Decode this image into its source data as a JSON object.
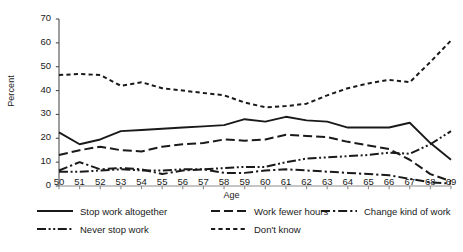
{
  "chart_data": {
    "type": "line",
    "title": "",
    "xlabel": "Age",
    "ylabel": "Percent",
    "xlim": [
      50,
      69
    ],
    "ylim": [
      0,
      70
    ],
    "ytick_step": 10,
    "grid": false,
    "legend_position": "bottom",
    "x": [
      50,
      51,
      52,
      53,
      54,
      55,
      56,
      57,
      58,
      59,
      60,
      61,
      62,
      63,
      64,
      65,
      66,
      67,
      68,
      69
    ],
    "xticklabels": [
      "50",
      "51",
      "52",
      "53",
      "54",
      "55",
      "56",
      "57",
      "58",
      "59",
      "60",
      "61",
      "62",
      "63",
      "64",
      "65",
      "66",
      "67",
      "68",
      "69"
    ],
    "yticklabels": [
      "0",
      "10",
      "20",
      "30",
      "40",
      "50",
      "60",
      "70"
    ],
    "series": [
      {
        "name": "Stop work altogether",
        "dash": "solid",
        "color": "#1a1a1a",
        "values": [
          22.5,
          17.5,
          19.5,
          23.0,
          23.5,
          24.0,
          24.5,
          25.0,
          25.5,
          28.0,
          27.0,
          29.0,
          27.5,
          27.0,
          24.5,
          24.5,
          24.5,
          26.5,
          18.0,
          11.0
        ]
      },
      {
        "name": "Work fewer hours",
        "dash": "long-dash",
        "color": "#1a1a1a",
        "values": [
          13.0,
          15.0,
          16.5,
          15.0,
          14.5,
          16.5,
          17.5,
          18.0,
          19.5,
          19.0,
          19.5,
          21.5,
          21.0,
          20.5,
          18.5,
          17.0,
          15.5,
          11.0,
          5.0,
          2.0
        ]
      },
      {
        "name": "Change kind of work",
        "dash": "dash-dot",
        "color": "#1a1a1a",
        "values": [
          6.5,
          10.0,
          7.0,
          7.5,
          7.0,
          5.0,
          6.5,
          7.0,
          5.5,
          5.5,
          6.5,
          7.0,
          6.5,
          6.0,
          5.5,
          5.0,
          4.5,
          3.0,
          1.5,
          1.0
        ]
      },
      {
        "name": "Never stop work",
        "dash": "dash-dot-dot",
        "color": "#1a1a1a",
        "values": [
          6.0,
          6.0,
          6.5,
          7.0,
          6.5,
          6.5,
          7.0,
          7.0,
          7.5,
          8.0,
          8.0,
          10.0,
          11.5,
          12.0,
          12.5,
          13.0,
          14.0,
          13.5,
          17.5,
          23.0
        ]
      },
      {
        "name": "Don't know",
        "dash": "dotted",
        "color": "#1a1a1a",
        "values": [
          46.5,
          47.0,
          46.5,
          42.0,
          43.5,
          41.0,
          40.0,
          39.0,
          38.0,
          35.0,
          33.0,
          33.5,
          34.5,
          38.0,
          41.0,
          43.0,
          44.5,
          43.5,
          52.0,
          61.0
        ]
      }
    ]
  },
  "legend": {
    "items": [
      {
        "label": "Stop work altogether",
        "dash": "solid"
      },
      {
        "label": "Work fewer hours",
        "dash": "long-dash"
      },
      {
        "label": "Change kind of work",
        "dash": "dash-dot"
      },
      {
        "label": "Never stop work",
        "dash": "dash-dot-dot"
      },
      {
        "label": "Don't know",
        "dash": "dotted"
      }
    ]
  }
}
